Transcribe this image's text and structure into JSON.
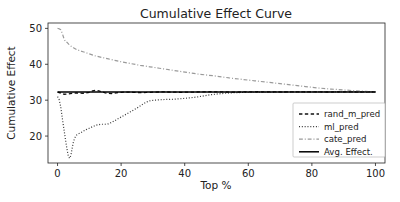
{
  "chart_data": {
    "type": "line",
    "title": "Cumulative Effect Curve",
    "xlabel": "Top %",
    "ylabel": "Cumulative Effect",
    "xlim": [
      -3,
      103
    ],
    "ylim": [
      12.5,
      51.5
    ],
    "xticks": [
      0,
      20,
      40,
      60,
      80,
      100
    ],
    "yticks": [
      20,
      30,
      40,
      50
    ],
    "grid": false,
    "legend_position": "lower right",
    "series": [
      {
        "name": "rand_m_pred",
        "style": "dashed",
        "color": "#101010",
        "width": 1.3,
        "x": [
          0,
          1,
          2,
          3,
          4,
          5,
          6,
          7,
          8,
          9,
          10,
          11,
          12,
          13,
          14,
          15,
          16,
          17,
          18,
          19,
          20,
          22,
          24,
          26,
          28,
          30,
          33,
          36,
          39,
          42,
          45,
          48,
          51,
          55,
          59,
          63,
          67,
          71,
          75,
          80,
          85,
          90,
          95,
          100
        ],
        "y": [
          32.25,
          32.0,
          31.65,
          31.7,
          31.85,
          31.95,
          32.0,
          31.95,
          31.9,
          32.0,
          32.2,
          32.6,
          32.75,
          32.6,
          32.3,
          32.05,
          31.9,
          31.85,
          31.95,
          32.1,
          32.2,
          32.25,
          32.2,
          32.1,
          32.15,
          32.25,
          32.3,
          32.25,
          32.2,
          32.25,
          32.3,
          32.35,
          32.3,
          32.25,
          32.3,
          32.35,
          32.3,
          32.28,
          32.3,
          32.3,
          32.28,
          32.3,
          32.28,
          32.3
        ]
      },
      {
        "name": "ml_pred",
        "style": "dotted",
        "color": "#3a3a3a",
        "width": 1.2,
        "x": [
          0,
          0.5,
          1,
          1.5,
          2,
          2.5,
          3,
          3.4,
          3.8,
          4.2,
          4.6,
          5,
          5.5,
          6,
          6.5,
          7,
          8,
          9,
          10,
          11,
          12,
          13,
          14,
          15,
          16,
          17,
          18,
          19,
          20,
          21,
          22,
          23,
          24,
          25,
          26,
          27,
          28,
          29,
          30,
          32,
          34,
          36,
          38,
          40,
          42,
          44,
          46,
          48,
          50,
          53,
          56,
          60,
          65,
          70,
          75,
          80,
          85,
          90,
          95,
          100
        ],
        "y": [
          31.0,
          30.2,
          28.2,
          25.0,
          22.0,
          19.0,
          16.2,
          14.4,
          13.8,
          14.6,
          16.6,
          18.4,
          19.6,
          20.3,
          20.6,
          20.8,
          21.3,
          21.8,
          22.2,
          22.6,
          23.0,
          23.2,
          23.3,
          23.3,
          23.4,
          23.8,
          24.3,
          24.8,
          25.3,
          25.8,
          26.3,
          26.8,
          27.3,
          27.8,
          28.4,
          29.0,
          29.5,
          29.8,
          29.95,
          30.1,
          30.2,
          30.25,
          30.35,
          30.5,
          30.7,
          30.9,
          31.2,
          31.5,
          31.7,
          31.95,
          32.1,
          32.2,
          32.25,
          32.28,
          32.3,
          32.3,
          32.3,
          32.3,
          32.3,
          32.3
        ]
      },
      {
        "name": "cate_pred",
        "style": "dashdot",
        "color": "#9a9a9a",
        "width": 1.2,
        "x": [
          0,
          0.5,
          1,
          1.5,
          2,
          2.5,
          3,
          3.5,
          4,
          5,
          6,
          7,
          8,
          9,
          10,
          12,
          14,
          16,
          18,
          20,
          23,
          26,
          29,
          32,
          35,
          38,
          41,
          44,
          47,
          50,
          54,
          58,
          62,
          66,
          70,
          74,
          78,
          82,
          86,
          90,
          94,
          97,
          100
        ],
        "y": [
          50.0,
          49.9,
          49.6,
          48.6,
          47.2,
          46.3,
          46.1,
          45.6,
          45.2,
          44.6,
          44.1,
          43.8,
          43.5,
          43.2,
          42.9,
          42.3,
          41.9,
          41.5,
          41.1,
          40.7,
          40.2,
          39.7,
          39.3,
          38.9,
          38.5,
          38.1,
          37.7,
          37.3,
          37.0,
          36.7,
          36.2,
          35.8,
          35.4,
          35.0,
          34.6,
          34.2,
          33.8,
          33.4,
          33.1,
          32.85,
          32.6,
          32.45,
          32.3
        ]
      },
      {
        "name": "Avg. Effect.",
        "style": "solid",
        "color": "#000000",
        "width": 1.5,
        "x": [
          0,
          100
        ],
        "y": [
          32.3,
          32.3
        ]
      }
    ]
  },
  "legend": {
    "entries": [
      {
        "label": "rand_m_pred"
      },
      {
        "label": "ml_pred"
      },
      {
        "label": "cate_pred"
      },
      {
        "label": "Avg. Effect."
      }
    ]
  }
}
